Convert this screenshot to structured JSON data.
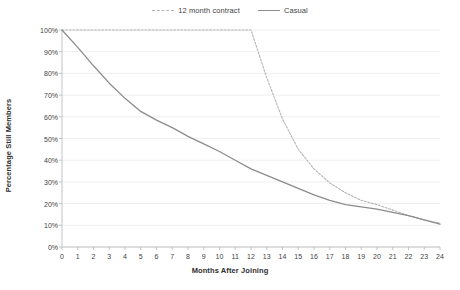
{
  "chart_data": {
    "type": "line",
    "title": "",
    "xlabel": "Months After Joining",
    "ylabel": "Percentage Still Members",
    "xlim": [
      0,
      24
    ],
    "ylim": [
      0,
      100
    ],
    "grid": "horizontal",
    "legend_position": "top-center",
    "x": [
      0,
      1,
      2,
      3,
      4,
      5,
      6,
      7,
      8,
      9,
      10,
      11,
      12,
      13,
      14,
      15,
      16,
      17,
      18,
      19,
      20,
      21,
      22,
      23,
      24
    ],
    "xticklabels": [
      "0",
      "1",
      "2",
      "3",
      "4",
      "5",
      "6",
      "7",
      "8",
      "9",
      "10",
      "11",
      "12",
      "13",
      "14",
      "15",
      "16",
      "17",
      "18",
      "19",
      "20",
      "21",
      "22",
      "23",
      "24"
    ],
    "yticklabels": [
      "0%",
      "10%",
      "20%",
      "30%",
      "40%",
      "50%",
      "60%",
      "70%",
      "80%",
      "90%",
      "100%"
    ],
    "yticks": [
      0,
      10,
      20,
      30,
      40,
      50,
      60,
      70,
      80,
      90,
      100
    ],
    "series": [
      {
        "name": "12 month contract",
        "style": "dashed",
        "color": "#b4b4b4",
        "values": [
          100,
          100,
          100,
          100,
          100,
          100,
          100,
          100,
          100,
          100,
          100,
          100,
          100,
          78,
          59,
          45,
          36,
          29.5,
          25,
          21.5,
          19.5,
          17,
          14.5,
          12.5,
          11
        ]
      },
      {
        "name": "Casual",
        "style": "solid",
        "color": "#8c8c8c",
        "values": [
          100,
          92,
          83.5,
          75.5,
          68.5,
          62.5,
          58.5,
          55,
          51,
          47.5,
          44,
          40,
          36,
          33,
          30,
          27,
          24,
          21.5,
          19.5,
          18.5,
          17.5,
          16,
          14.5,
          12.5,
          10.5
        ]
      }
    ]
  },
  "legend": {
    "entries": [
      {
        "label": "12 month contract"
      },
      {
        "label": "Casual"
      }
    ]
  }
}
